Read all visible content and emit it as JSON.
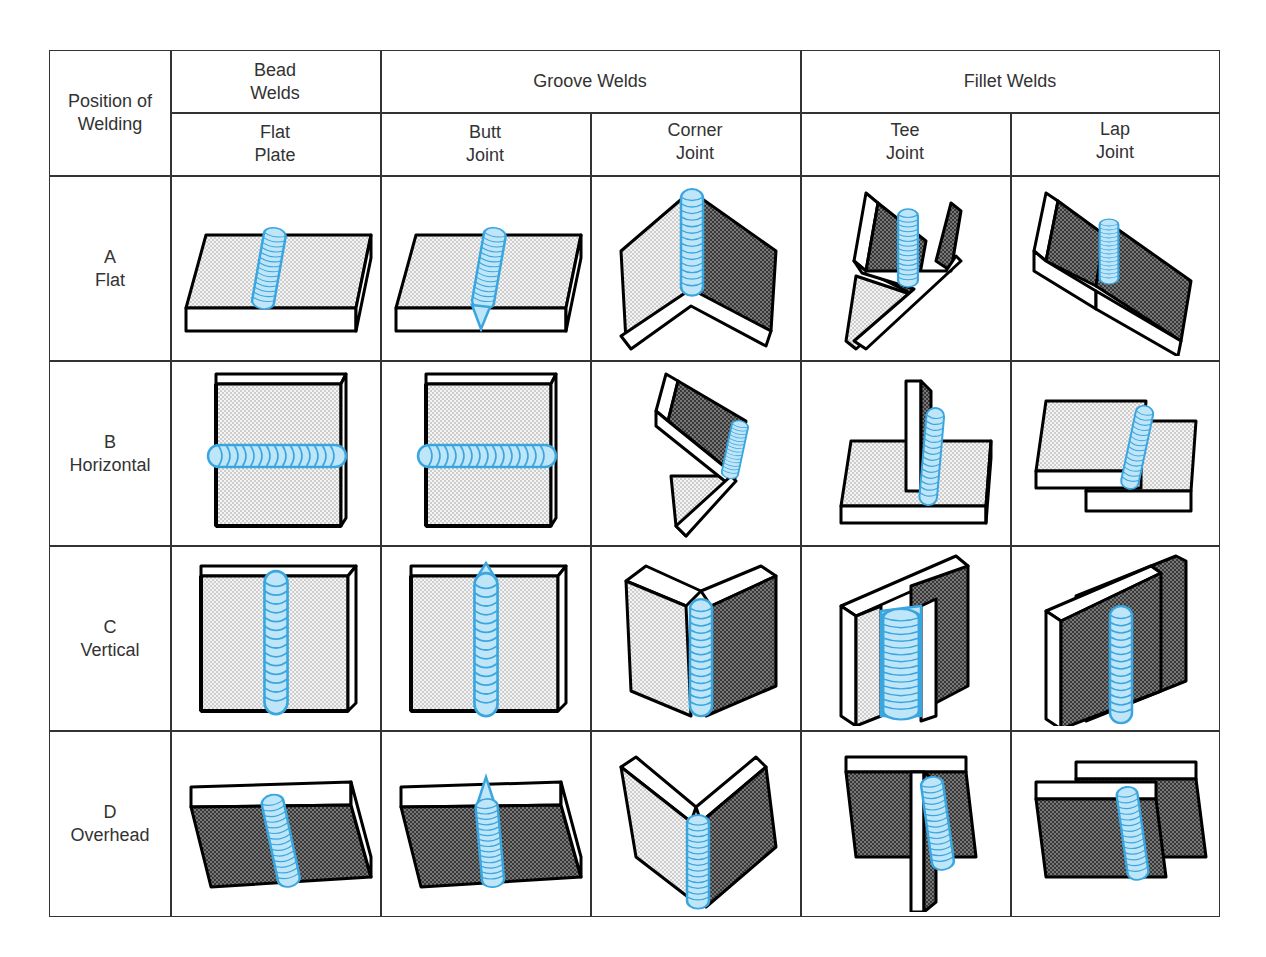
{
  "table": {
    "row_header_title": "Position of\nWelding",
    "groups": [
      {
        "label": "Bead\nWelds",
        "subcolumns": [
          "Flat\nPlate"
        ]
      },
      {
        "label": "Groove Welds",
        "subcolumns": [
          "Butt\nJoint",
          "Corner\nJoint"
        ]
      },
      {
        "label": "Fillet Welds",
        "subcolumns": [
          "Tee\nJoint",
          "Lap\nJoint"
        ]
      }
    ],
    "rows": [
      {
        "label": "A\nFlat",
        "cells": [
          "flat-plate-bead-flat",
          "butt-joint-flat",
          "corner-joint-flat",
          "tee-joint-flat",
          "lap-joint-flat"
        ]
      },
      {
        "label": "B\nHorizontal",
        "cells": [
          "flat-plate-bead-horizontal",
          "butt-joint-horizontal",
          "corner-joint-horizontal",
          "tee-joint-horizontal",
          "lap-joint-horizontal"
        ]
      },
      {
        "label": "C\nVertical",
        "cells": [
          "flat-plate-bead-vertical",
          "butt-joint-vertical",
          "corner-joint-vertical",
          "tee-joint-vertical",
          "lap-joint-vertical"
        ]
      },
      {
        "label": "D\nOverhead",
        "cells": [
          "flat-plate-bead-overhead",
          "butt-joint-overhead",
          "corner-joint-overhead",
          "tee-joint-overhead",
          "lap-joint-overhead"
        ]
      }
    ]
  },
  "colors": {
    "weld": "#3aa6e0",
    "weld_fill": "#bfe6f8",
    "grid_line": "#333333",
    "plate_outline": "#000000"
  }
}
